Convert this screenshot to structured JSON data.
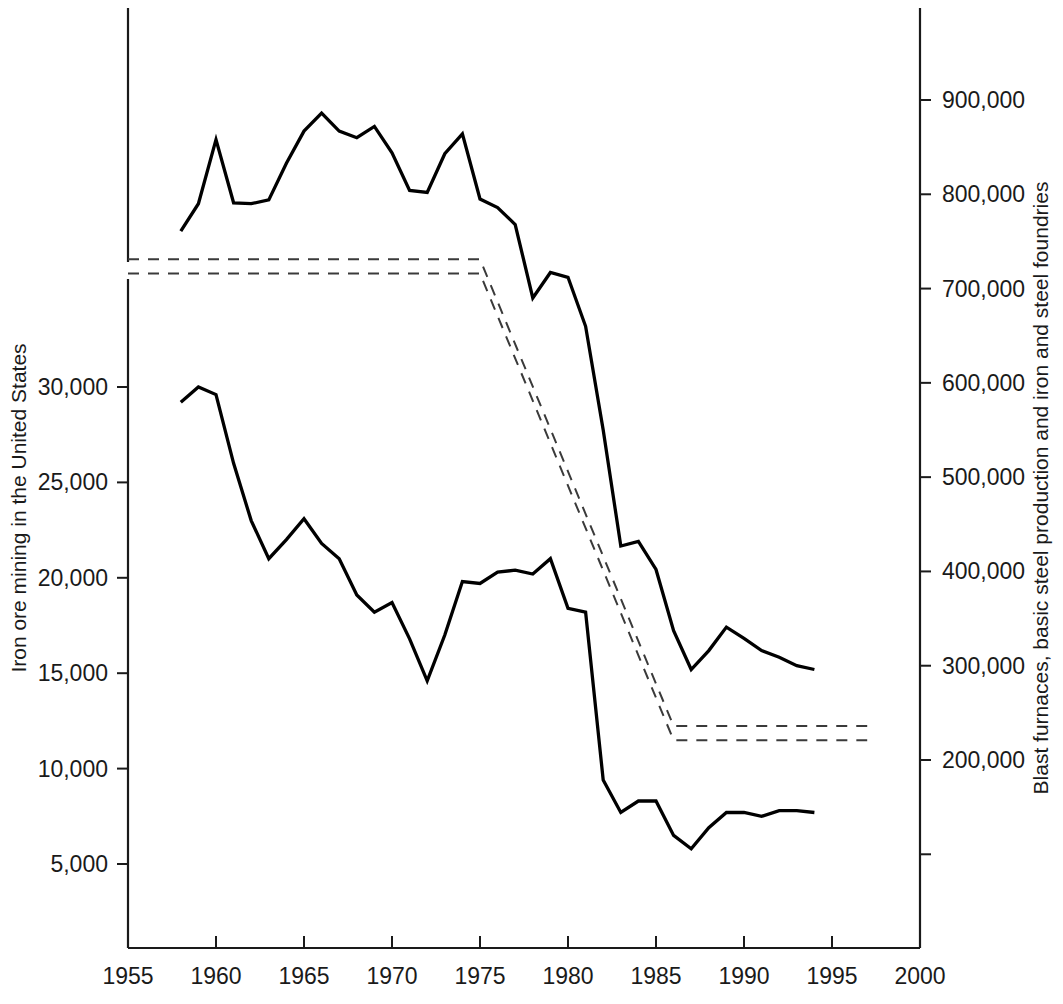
{
  "chart_data": {
    "type": "line",
    "title": "",
    "subtitle": "",
    "grid": false,
    "legend_position": "none",
    "xlabel": "",
    "x_ticks": [
      1955,
      1960,
      1965,
      1970,
      1975,
      1980,
      1985,
      1990,
      1995,
      2000
    ],
    "x_tick_labels": [
      "1955",
      "1960",
      "1965",
      "1970",
      "1975",
      "1980",
      "1985",
      "1990",
      "1995",
      "2000"
    ],
    "xlim": [
      1955,
      2000
    ],
    "left_axis": {
      "label": "Iron ore mining in the United States",
      "ticks": [
        5000,
        10000,
        15000,
        20000,
        25000,
        30000
      ],
      "tick_labels": [
        "5,000",
        "10,000",
        "15,000",
        "20,000",
        "25,000",
        "30,000"
      ],
      "lim": [
        0,
        35000
      ],
      "broken": true
    },
    "right_axis": {
      "label": "Blast furnaces, basic steel production and iron and steel foundries",
      "ticks": [
        200000,
        300000,
        400000,
        500000,
        600000,
        700000,
        800000,
        900000
      ],
      "tick_labels": [
        "200,000",
        "300,000",
        "400,000",
        "500,000",
        "600,000",
        "700,000",
        "800,000",
        "900,000"
      ],
      "lim": [
        100000,
        1000000
      ]
    },
    "series": [
      {
        "name": "Blast furnaces, basic steel production and iron and steel foundries",
        "axis": "right",
        "style": "solid",
        "x": [
          1958,
          1959,
          1960,
          1961,
          1962,
          1963,
          1964,
          1965,
          1966,
          1967,
          1968,
          1969,
          1970,
          1971,
          1972,
          1973,
          1974,
          1975,
          1976,
          1977,
          1978,
          1979,
          1980,
          1981,
          1982,
          1983,
          1984,
          1985,
          1986,
          1987,
          1988,
          1989,
          1990,
          1991,
          1992,
          1993,
          1994
        ],
        "values": [
          761000,
          790000,
          858000,
          791000,
          790000,
          794000,
          833000,
          867000,
          886000,
          867000,
          860000,
          872000,
          844000,
          804000,
          802000,
          843000,
          864000,
          795000,
          786000,
          768000,
          690000,
          717000,
          712000,
          660000,
          550000,
          427000,
          432000,
          402000,
          337000,
          296000,
          316000,
          341000,
          329000,
          316000,
          309000,
          300000,
          296000
        ]
      },
      {
        "name": "Iron ore mining in the United States",
        "axis": "left",
        "style": "solid",
        "x": [
          1958,
          1959,
          1960,
          1961,
          1962,
          1963,
          1964,
          1965,
          1966,
          1967,
          1968,
          1969,
          1970,
          1971,
          1972,
          1973,
          1974,
          1975,
          1976,
          1977,
          1978,
          1979,
          1980,
          1981,
          1982,
          1983,
          1984,
          1985,
          1986,
          1987,
          1988,
          1989,
          1990,
          1991,
          1992,
          1993,
          1994
        ],
        "values": [
          29200,
          30000,
          29600,
          26000,
          23000,
          21000,
          22000,
          23100,
          21800,
          21000,
          19100,
          18200,
          18700,
          16800,
          14600,
          17000,
          19800,
          19700,
          20300,
          20400,
          20200,
          21000,
          18400,
          18200,
          9400,
          7700,
          8300,
          8300,
          6500,
          5800,
          6900,
          7700,
          7700,
          7500,
          7800,
          7800,
          7700
        ]
      },
      {
        "name": "confidence-band-upper",
        "axis": "right",
        "style": "dashed",
        "x": [
          1955,
          1975,
          1986,
          1997
        ],
        "values": [
          731000,
          731000,
          236000,
          236000
        ]
      },
      {
        "name": "confidence-band-lower",
        "axis": "right",
        "style": "dashed",
        "x": [
          1955,
          1975,
          1986,
          1997
        ],
        "values": [
          716000,
          716000,
          221000,
          221000
        ]
      }
    ],
    "annotations": []
  },
  "geometry": {
    "plot_left": 128,
    "plot_right": 920,
    "plot_top": 8,
    "plot_bottom": 948,
    "axis_break_top": 262,
    "axis_break_bottom": 279
  }
}
